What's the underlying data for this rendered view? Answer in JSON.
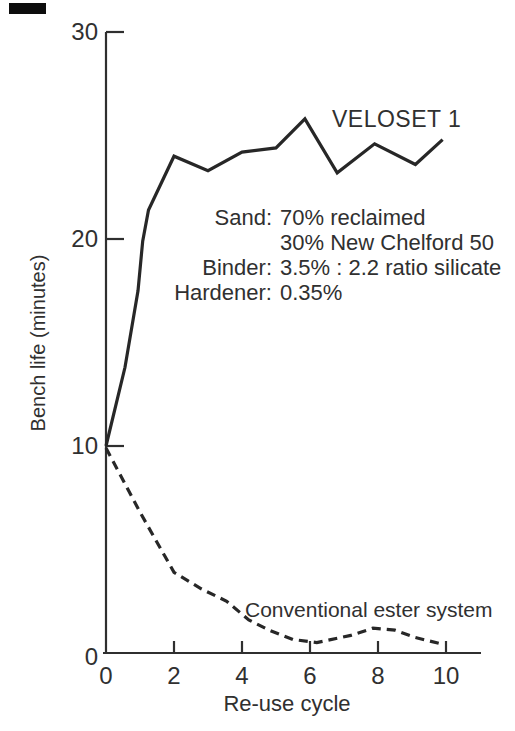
{
  "figure": {
    "background": "#ffffff",
    "ink_color": "#272727"
  },
  "chart_data": {
    "type": "line",
    "title": "",
    "xlabel": "Re-use cycle",
    "ylabel": "Bench life (minutes)",
    "xlim": [
      0,
      11
    ],
    "ylim": [
      0,
      30
    ],
    "xticks": [
      0,
      2,
      4,
      6,
      8,
      10
    ],
    "yticks": [
      0,
      10,
      20,
      30
    ],
    "grid": false,
    "legend_position": "inline-labels",
    "x": [
      0,
      1,
      2,
      3,
      4,
      5,
      6,
      7,
      8,
      9,
      10
    ],
    "series": [
      {
        "name": "VELOSET 1",
        "style": "solid",
        "values": [
          10,
          20,
          24,
          23.3,
          24.2,
          24.4,
          25.8,
          23.3,
          24.6,
          23.6,
          24.8
        ],
        "vertices": [
          [
            0,
            10
          ],
          [
            0.56,
            13.8
          ],
          [
            0.94,
            17.5
          ],
          [
            1.08,
            19.9
          ],
          [
            1.25,
            21.4
          ],
          [
            2,
            24.0
          ],
          [
            3,
            23.3
          ],
          [
            4,
            24.2
          ],
          [
            5,
            24.4
          ],
          [
            5.85,
            25.8
          ],
          [
            6.8,
            23.2
          ],
          [
            7.9,
            24.6
          ],
          [
            9.1,
            23.6
          ],
          [
            9.9,
            24.8
          ]
        ]
      },
      {
        "name": "Conventional ester system",
        "style": "dashed",
        "values": [
          10,
          6.8,
          3.9,
          3.0,
          1.7,
          0.9,
          0.5,
          0.8,
          1.2,
          0.8,
          0.4
        ],
        "vertices": [
          [
            0,
            9.9
          ],
          [
            1,
            6.8
          ],
          [
            2,
            3.9
          ],
          [
            2.8,
            3.1
          ],
          [
            3.55,
            2.5
          ],
          [
            4.2,
            1.6
          ],
          [
            4.8,
            1.1
          ],
          [
            5.5,
            0.65
          ],
          [
            6.2,
            0.5
          ],
          [
            7.2,
            0.85
          ],
          [
            7.85,
            1.2
          ],
          [
            8.5,
            1.1
          ],
          [
            9.1,
            0.75
          ],
          [
            9.95,
            0.4
          ]
        ]
      }
    ]
  },
  "annotation": {
    "rows": [
      {
        "label": "Sand:",
        "value": "70% reclaimed"
      },
      {
        "label": "",
        "value": "30% New Chelford 50"
      },
      {
        "label": "Binder:",
        "value": "3.5% : 2.2 ratio silicate"
      },
      {
        "label": "Hardener:",
        "value": "0.35%"
      }
    ]
  }
}
